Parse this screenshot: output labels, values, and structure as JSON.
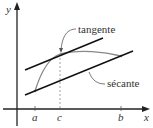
{
  "diagram": {
    "title": "",
    "axes": {
      "x_label": "x",
      "y_label": "y"
    },
    "ticks": [
      {
        "label": "a",
        "x": 35
      },
      {
        "label": "c",
        "x": 60
      },
      {
        "label": "b",
        "x": 121
      }
    ],
    "annotations": {
      "tangent": "tangente",
      "secant": "sécante"
    },
    "colors": {
      "axes": "#222222",
      "lines": "#111111",
      "curve": "#888888",
      "dashed": "#999999",
      "text": "#333333"
    }
  }
}
